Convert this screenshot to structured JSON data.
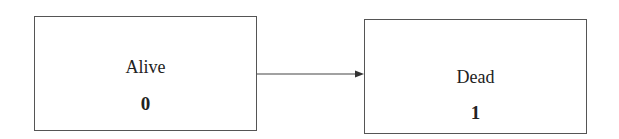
{
  "diagram": {
    "nodes": [
      {
        "id": "alive",
        "label": "Alive",
        "value": "0"
      },
      {
        "id": "dead",
        "label": "Dead",
        "value": "1"
      }
    ],
    "edges": [
      {
        "from": "alive",
        "to": "dead"
      }
    ]
  }
}
